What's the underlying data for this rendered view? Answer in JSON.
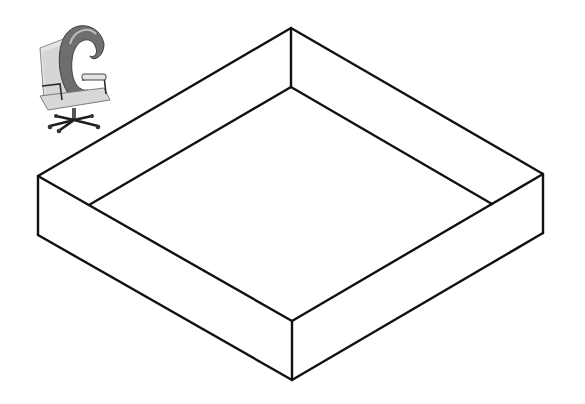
{
  "diagram": {
    "type": "isometric-open-box",
    "stroke_color": "#111111",
    "background": "#ffffff",
    "outer_top": {
      "top": [
        291,
        28
      ],
      "right": [
        543,
        174
      ],
      "front": [
        292,
        321
      ],
      "left": [
        38,
        176
      ]
    },
    "outer_bottom": {
      "right": [
        543,
        233
      ],
      "front": [
        292,
        380
      ],
      "left": [
        38,
        235
      ]
    },
    "inner_floor": {
      "top": [
        291,
        87
      ],
      "right": [
        492,
        204
      ],
      "front": [
        292,
        320
      ],
      "left": [
        89,
        205
      ]
    }
  },
  "logo": {
    "icon": "office-chair-with-letter-c-icon",
    "letter": "C",
    "colors": {
      "letter": "#6e6e6e",
      "chair": "#cfcfcf",
      "base": "#222222"
    }
  }
}
